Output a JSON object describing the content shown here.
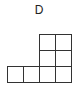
{
  "figure": {
    "label": "D",
    "cell_size_px": 16,
    "line_color": "#333333",
    "cells": [
      {
        "row": 0,
        "col": 2
      },
      {
        "row": 0,
        "col": 3
      },
      {
        "row": 1,
        "col": 2
      },
      {
        "row": 1,
        "col": 3
      },
      {
        "row": 2,
        "col": 0
      },
      {
        "row": 2,
        "col": 1
      },
      {
        "row": 2,
        "col": 2
      },
      {
        "row": 2,
        "col": 3
      }
    ],
    "origin": {
      "x": 7,
      "y": 34
    }
  }
}
